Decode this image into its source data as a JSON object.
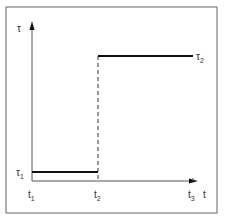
{
  "diagram": {
    "type": "step-function",
    "y_axis_label": "τ",
    "x_axis_label": "t",
    "levels": [
      {
        "name": "τ",
        "sub": "1",
        "from": "t1",
        "to": "t2"
      },
      {
        "name": "τ",
        "sub": "2",
        "from": "t2",
        "to": "t3"
      }
    ],
    "ticks": [
      {
        "name": "t",
        "sub": "1"
      },
      {
        "name": "t",
        "sub": "2"
      },
      {
        "name": "t",
        "sub": "3"
      }
    ],
    "transition": "dashed vertical at t2"
  },
  "colors": {
    "line": "#111111",
    "frame": "#555555",
    "text": "#333333"
  }
}
